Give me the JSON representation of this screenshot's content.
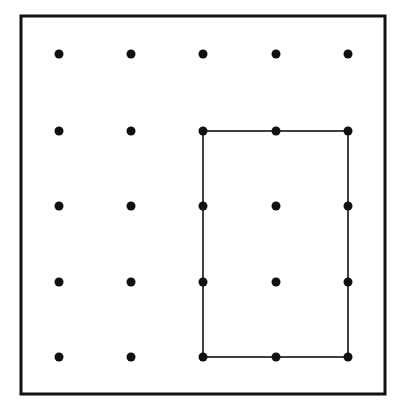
{
  "diagram": {
    "type": "geoboard",
    "grid_size": 5,
    "columns_x": [
      59,
      131,
      203,
      276,
      348
    ],
    "rows_y": [
      54,
      131,
      206,
      282,
      357
    ],
    "frame": {
      "x": 21,
      "y": 16,
      "w": 364,
      "h": 378
    },
    "rectangle": {
      "from_col": 2,
      "from_row": 1,
      "to_col": 4,
      "to_row": 4
    },
    "colors": {
      "ink": "#111111",
      "background": "#ffffff"
    }
  }
}
